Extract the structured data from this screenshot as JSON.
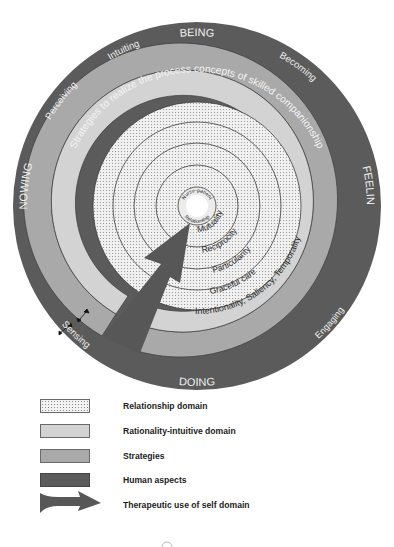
{
  "colors": {
    "human_aspects": "#5b5b5b",
    "strategies": "#a9a9a9",
    "rationality_intuitive": "#d3d3d3",
    "relationship_bg": "#f0f0f0",
    "relationship_dots": "#8c8c8c",
    "ring_line": "#3c3c3c",
    "arrow": "#575757",
    "light_text": "#f2f2f2",
    "dark_text": "#2a2a2a"
  },
  "diagram": {
    "human_aspects": {
      "being": "BEING",
      "doing": "DOING",
      "knowing": "KNOWING",
      "feeling": "FEELING",
      "intuiting": "Intuiting",
      "perceiving": "Perceiving",
      "becoming": "Becoming",
      "sensing": "Sensing",
      "engaging": "Engaging"
    },
    "strategies_text": "Strategies to realize the process concepts of skilled companionship",
    "rationality_text": "Intentionality, Saliency, Temporality",
    "relationship_rings": {
      "graceful_care": "Graceful care",
      "particularity": "Particularity",
      "reciprocity": "Reciprocity",
      "mutuality": "Mutuality"
    },
    "center": {
      "top": "Nurse-patient",
      "bottom": "Relationship"
    }
  },
  "legend": {
    "items": [
      {
        "label": "Relationship domain",
        "swatch": "dotted"
      },
      {
        "label": "Rationality-intuitive domain",
        "swatch": "light"
      },
      {
        "label": "Strategies",
        "swatch": "medium"
      },
      {
        "label": "Human aspects",
        "swatch": "dark"
      },
      {
        "label": "Therapeutic use of self domain",
        "swatch": "arrow"
      }
    ]
  }
}
